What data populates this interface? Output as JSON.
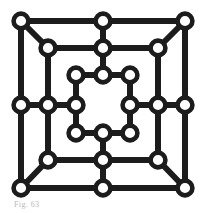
{
  "figure": {
    "caption": "Fig. 63",
    "colors": {
      "background": "#ffffff",
      "edge": "#1c1c1c",
      "node_stroke": "#1c1c1c",
      "node_fill": "#ffffff",
      "caption_text": "#b9b9b9"
    },
    "geometry": {
      "width": 206,
      "height": 213,
      "edge_width": 6,
      "node_radius": 7.4,
      "node_stroke_width": 4.6
    }
  },
  "chart_data": {
    "type": "diagram",
    "rings": [
      {
        "name": "outer-ring",
        "node_count": 8,
        "left": 21,
        "top": 21,
        "right": 185,
        "bottom": 188,
        "mid_x": 103,
        "mid_y": 105
      },
      {
        "name": "middle-ring",
        "node_count": 8,
        "left": 48,
        "top": 48,
        "right": 158,
        "bottom": 160,
        "mid_x": 103,
        "mid_y": 105
      },
      {
        "name": "inner-ring",
        "node_count": 8,
        "left": 76,
        "top": 75,
        "right": 130,
        "bottom": 133,
        "mid_x": 103,
        "mid_y": 105
      }
    ],
    "node_count": 24,
    "edge_count": 36,
    "center_is_empty": true,
    "nodes": [
      {
        "id": "o-tl",
        "ring": "outer",
        "x": 21,
        "y": 21
      },
      {
        "id": "o-tm",
        "ring": "outer",
        "x": 103,
        "y": 21
      },
      {
        "id": "o-tr",
        "ring": "outer",
        "x": 185,
        "y": 21
      },
      {
        "id": "o-ml",
        "ring": "outer",
        "x": 21,
        "y": 105
      },
      {
        "id": "o-mr",
        "ring": "outer",
        "x": 185,
        "y": 105
      },
      {
        "id": "o-bl",
        "ring": "outer",
        "x": 21,
        "y": 188
      },
      {
        "id": "o-bm",
        "ring": "outer",
        "x": 103,
        "y": 188
      },
      {
        "id": "o-br",
        "ring": "outer",
        "x": 185,
        "y": 188
      },
      {
        "id": "m-tl",
        "ring": "middle",
        "x": 48,
        "y": 48
      },
      {
        "id": "m-tm",
        "ring": "middle",
        "x": 103,
        "y": 48
      },
      {
        "id": "m-tr",
        "ring": "middle",
        "x": 158,
        "y": 48
      },
      {
        "id": "m-ml",
        "ring": "middle",
        "x": 48,
        "y": 105
      },
      {
        "id": "m-mr",
        "ring": "middle",
        "x": 158,
        "y": 105
      },
      {
        "id": "m-bl",
        "ring": "middle",
        "x": 48,
        "y": 160
      },
      {
        "id": "m-bm",
        "ring": "middle",
        "x": 103,
        "y": 160
      },
      {
        "id": "m-br",
        "ring": "middle",
        "x": 158,
        "y": 160
      },
      {
        "id": "i-tl",
        "ring": "inner",
        "x": 76,
        "y": 75
      },
      {
        "id": "i-tm",
        "ring": "inner",
        "x": 103,
        "y": 75
      },
      {
        "id": "i-tr",
        "ring": "inner",
        "x": 130,
        "y": 75
      },
      {
        "id": "i-ml",
        "ring": "inner",
        "x": 76,
        "y": 105
      },
      {
        "id": "i-mr",
        "ring": "inner",
        "x": 130,
        "y": 105
      },
      {
        "id": "i-bl",
        "ring": "inner",
        "x": 76,
        "y": 133
      },
      {
        "id": "i-bm",
        "ring": "inner",
        "x": 103,
        "y": 133
      },
      {
        "id": "i-br",
        "ring": "inner",
        "x": 130,
        "y": 133
      }
    ],
    "edges": [
      [
        "o-tl",
        "o-tm"
      ],
      [
        "o-tm",
        "o-tr"
      ],
      [
        "o-tl",
        "o-ml"
      ],
      [
        "o-ml",
        "o-bl"
      ],
      [
        "o-tr",
        "o-mr"
      ],
      [
        "o-mr",
        "o-br"
      ],
      [
        "o-bl",
        "o-bm"
      ],
      [
        "o-bm",
        "o-br"
      ],
      [
        "m-tl",
        "m-tm"
      ],
      [
        "m-tm",
        "m-tr"
      ],
      [
        "m-tl",
        "m-ml"
      ],
      [
        "m-ml",
        "m-bl"
      ],
      [
        "m-tr",
        "m-mr"
      ],
      [
        "m-mr",
        "m-br"
      ],
      [
        "m-bl",
        "m-bm"
      ],
      [
        "m-bm",
        "m-br"
      ],
      [
        "i-tl",
        "i-tm"
      ],
      [
        "i-tm",
        "i-tr"
      ],
      [
        "i-tl",
        "i-ml"
      ],
      [
        "i-ml",
        "i-bl"
      ],
      [
        "i-tr",
        "i-mr"
      ],
      [
        "i-mr",
        "i-br"
      ],
      [
        "i-bl",
        "i-bm"
      ],
      [
        "i-bm",
        "i-br"
      ],
      [
        "o-ml",
        "m-ml"
      ],
      [
        "m-ml",
        "i-ml"
      ],
      [
        "o-mr",
        "m-mr"
      ],
      [
        "m-mr",
        "i-mr"
      ],
      [
        "o-tm",
        "m-tm"
      ],
      [
        "m-tm",
        "i-tm"
      ],
      [
        "o-bm",
        "m-bm"
      ],
      [
        "m-bm",
        "i-bm"
      ],
      [
        "m-tl",
        "o-tl"
      ],
      [
        "m-tr",
        "o-tr"
      ],
      [
        "m-bl",
        "o-bl"
      ],
      [
        "m-br",
        "o-br"
      ]
    ]
  }
}
